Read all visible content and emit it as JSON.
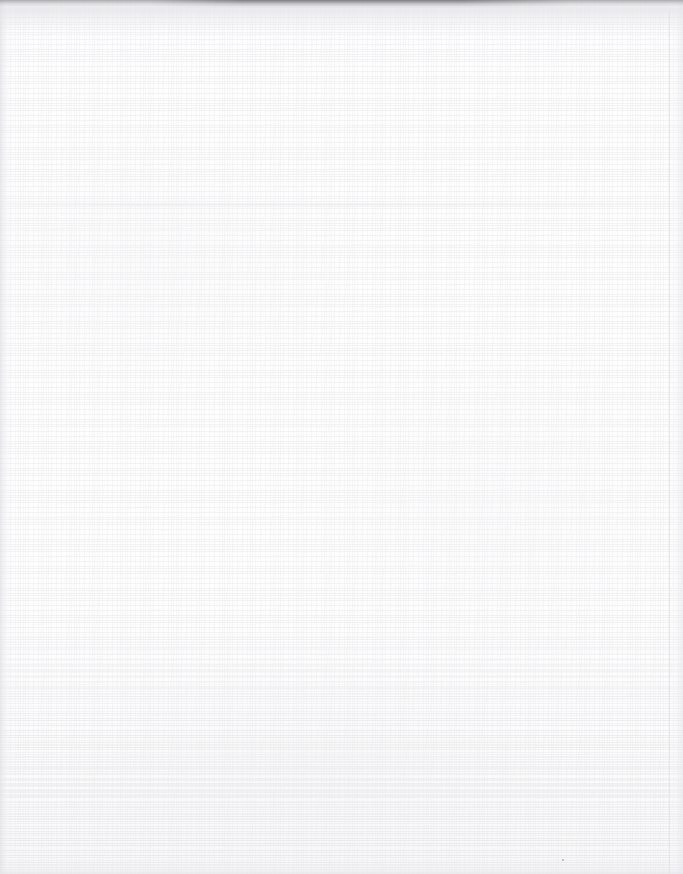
{
  "document": {
    "kind": "scanned-page",
    "content_type": "blank",
    "visible_text": "",
    "page_width_px": 683,
    "page_height_px": 874,
    "background_color": "#fefefe",
    "paper": {
      "surface": "woven-linen-texture",
      "weave_tone_color": "#e9e9ec",
      "texture_visible": true,
      "texture_density_note": "denser toward the lower portion of the sheet"
    },
    "artifacts": [
      {
        "name": "top-scan-edge-shadow",
        "type": "edge-shadow",
        "position": "top",
        "color": "#787880",
        "extent": "full width, darkest between the left-third and centre"
      },
      {
        "name": "left-edge-streak",
        "type": "vertical-streak",
        "position": "left",
        "color": "#e2e2e6"
      },
      {
        "name": "right-edge-streak",
        "type": "vertical-streak",
        "position": "right",
        "color": "#e8e8ec"
      },
      {
        "name": "right-scan-rule",
        "type": "thin-vertical-line",
        "position": "right",
        "color": "#e2e2e7"
      },
      {
        "name": "horizontal-crease",
        "type": "fold-crease",
        "position": "upper-third",
        "color": "#e7e7eb"
      },
      {
        "name": "bottom-scan-edge",
        "type": "edge-shadow",
        "position": "bottom",
        "color": "#e5e5e9"
      },
      {
        "name": "dust-speck",
        "type": "speck",
        "position": "lower-right",
        "color": "#78787e"
      }
    ]
  }
}
